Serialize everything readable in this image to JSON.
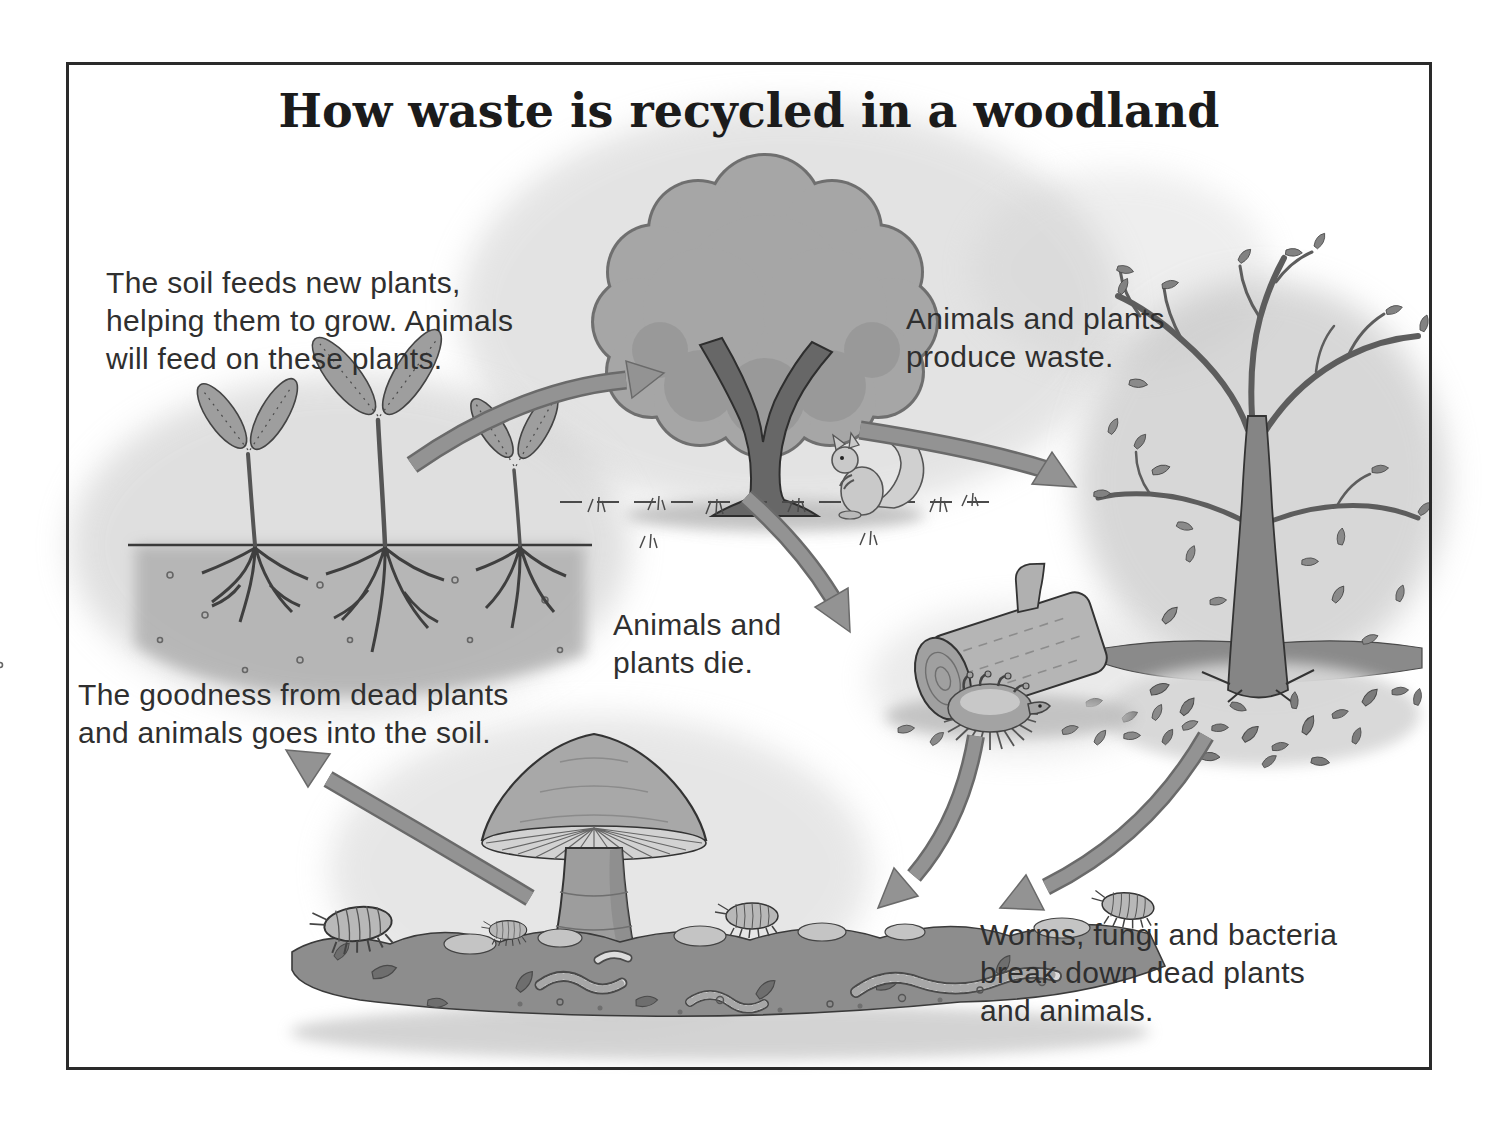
{
  "title": "How waste is recycled in a woodland",
  "captions": {
    "soil_feeds": {
      "line1": "The soil feeds new plants,",
      "line2": "helping them to grow. Animals",
      "line3": "will feed on these plants."
    },
    "produce_waste": {
      "line1": "Animals and plants",
      "line2": "produce waste."
    },
    "plants_die": {
      "line1": "Animals and",
      "line2": "plants die."
    },
    "goodness": {
      "line1": "The goodness from dead plants",
      "line2": "and animals goes into the soil."
    },
    "decomposers": {
      "line1": "Worms, fungi and bacteria",
      "line2": "break down dead plants",
      "line3": "and animals."
    }
  },
  "colors": {
    "background": "#ffffff",
    "ink": "#2f2f2f",
    "border": "#2a2a2a",
    "arrow": "#929292",
    "arrow_edge": "#6a6a6a",
    "canopy": "#a6a6a6",
    "trunk": "#676767",
    "soil_band": "#8d8d8d",
    "stipple": "#c9c9c9"
  },
  "illustrations": {
    "seedlings": "seedlings with roots in soil",
    "tree": "leafy tree with squirrel",
    "bare_tree": "tree shedding its leaves",
    "log": "fallen log with dead hedgehog",
    "mushroom": "toadstool fungus",
    "soil": "soil with worms and woodlice"
  }
}
